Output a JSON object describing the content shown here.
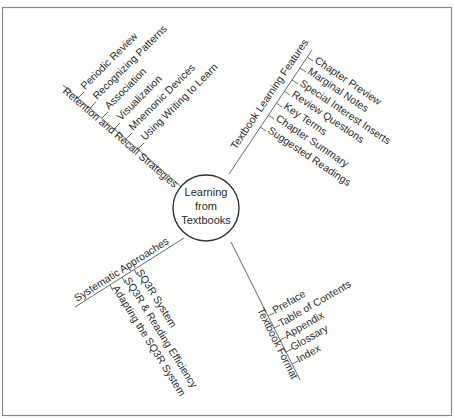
{
  "center": {
    "lines": [
      "Learning",
      "from",
      "Textbooks"
    ]
  },
  "branches": {
    "retention": {
      "label": "Retention and Recall Strategies",
      "items": [
        "Periodic Review",
        "Recognizing Patterns",
        "Association",
        "Visualization",
        "Mnemonic Devices",
        "Using Writing to Learn"
      ]
    },
    "features": {
      "label": "Textbook Learning Features",
      "items": [
        "Chapter Preview",
        "Marginal Notes",
        "Special Interest Inserts",
        "Review Questions",
        "Key Terms",
        "Chapter Summary",
        "Suggested Readings"
      ]
    },
    "systematic": {
      "label": "Systematic Approaches",
      "items": [
        "SQ3R System",
        "SQ3R & Reading Efficiency",
        "Adapting the SQ3R System"
      ]
    },
    "format": {
      "label": "Textbook Format",
      "items": [
        "Preface",
        "Table of Contents",
        "Appendix",
        "Glossary",
        "Index"
      ]
    }
  },
  "colors": {
    "line": "#6a6a6a",
    "text": "#2a2a2a",
    "frame": "#8a8a8a",
    "background": "#ffffff"
  }
}
